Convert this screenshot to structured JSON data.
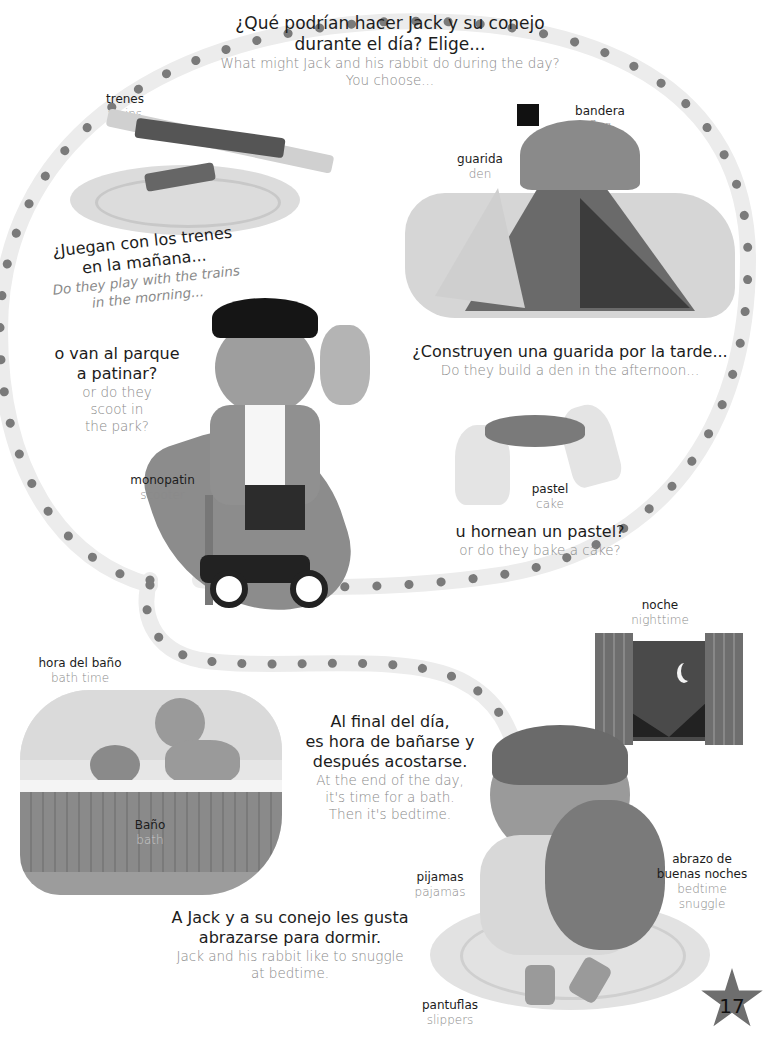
{
  "page": {
    "number": "17",
    "colors": {
      "path_band": "#ececec",
      "path_dot": "#7a7a7a",
      "star": "#6e6e6e",
      "text_primary": "#1c1c1c",
      "text_secondary": "#8a8a8a"
    }
  },
  "intro": {
    "es": [
      "¿Qué podrían hacer Jack y su conejo",
      "durante el día? Elige..."
    ],
    "en": [
      "What might Jack and his rabbit do during the day?",
      "You choose..."
    ]
  },
  "labels": {
    "trains": {
      "es": "trenes",
      "en": "trains"
    },
    "flag": {
      "es": "bandera",
      "en": "flag"
    },
    "den": {
      "es": "guarida",
      "en": "den"
    },
    "scooter": {
      "es": "monopatin",
      "en": "scooter"
    },
    "cake": {
      "es": "pastel",
      "en": "cake"
    },
    "bath_time": {
      "es": "hora del baño",
      "en": "bath time"
    },
    "bath": {
      "es": "Baño",
      "en": "bath"
    },
    "night": {
      "es": "noche",
      "en": "nighttime"
    },
    "pajamas": {
      "es": "pijamas",
      "en": "pajamas"
    },
    "snuggle": {
      "es": [
        "abrazo de",
        "buenas noches"
      ],
      "en": [
        "bedtime",
        "snuggle"
      ]
    },
    "slippers": {
      "es": "pantuflas",
      "en": "slippers"
    }
  },
  "captions": {
    "trains": {
      "es": [
        "¿Juegan con los trenes",
        "en la mañana..."
      ],
      "en": [
        "Do they play with the trains",
        "in the morning..."
      ]
    },
    "park": {
      "es": [
        "o van al parque",
        "a patinar?"
      ],
      "en": [
        "or do they",
        "scoot in",
        "the park?"
      ]
    },
    "den": {
      "es": [
        "¿Construyen una guarida por la tarde..."
      ],
      "en": [
        "Do they build a den in the afternoon..."
      ]
    },
    "cake": {
      "es": [
        "u hornean un pastel?"
      ],
      "en": [
        "or do they bake a cake?"
      ]
    },
    "evening": {
      "es": [
        "Al final del día,",
        "es hora de bañarse y",
        "después acostarse."
      ],
      "en": [
        "At the end of the day,",
        "it's time for a bath.",
        "Then it's bedtime."
      ]
    },
    "bedtime": {
      "es": [
        "A Jack y a su conejo les gusta",
        "abrazarse para dormir."
      ],
      "en": [
        "Jack and his rabbit like to snuggle",
        "at bedtime."
      ]
    }
  }
}
